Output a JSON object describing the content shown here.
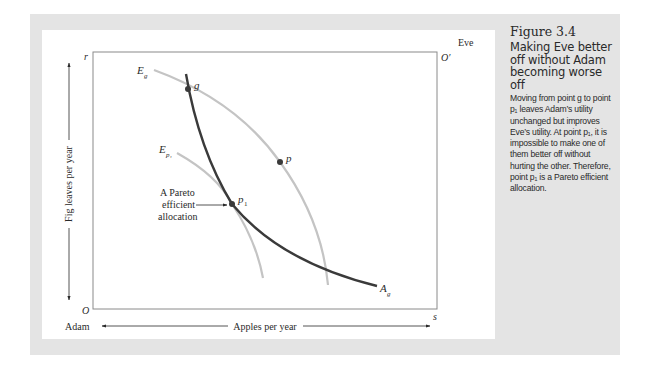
{
  "figure": {
    "number": "Figure 3.4",
    "title": "Making Eve better off without Adam becoming worse off",
    "caption": "Moving from point g to point p₁ leaves Adam’s utility unchanged but improves Eve’s utility. At point p₁, it is impossible to make one of them better off without hurting the other. Therefore, point p₁ is a Pareto efficient allocation."
  },
  "diagram": {
    "corner_labels": {
      "top_left": "r",
      "bottom_left": "O",
      "top_right": "O′",
      "bottom_right": "s"
    },
    "agents": {
      "origin_agent": "Adam",
      "opposite_agent": "Eve"
    },
    "axes": {
      "x_label": "Apples per year",
      "y_label": "Fig leaves per year"
    },
    "curves": [
      {
        "id": "E_g",
        "label": "E",
        "subscript": "g",
        "description": "Eve's indifference curve through g",
        "color": "#c4c4c4"
      },
      {
        "id": "E_p1",
        "label": "E",
        "subscript": "p₁",
        "description": "Eve's indifference curve through p1",
        "color": "#c4c4c4"
      },
      {
        "id": "A_g",
        "label": "A",
        "subscript": "g",
        "description": "Adam's indifference curve through g",
        "color": "#3a3a3a"
      }
    ],
    "points": [
      {
        "id": "g",
        "label": "g"
      },
      {
        "id": "p",
        "label": "p"
      },
      {
        "id": "p1",
        "label": "p",
        "subscript": "1"
      }
    ],
    "annotation": {
      "lines": [
        "A Pareto",
        "efficient",
        "allocation"
      ],
      "points_to": "p1"
    },
    "colors": {
      "frame": "#e4e4e4",
      "axis": "#7a7a7a",
      "dark_curve": "#3a3a3a",
      "light_curve": "#c4c4c4",
      "text": "#2a2a2a"
    }
  }
}
